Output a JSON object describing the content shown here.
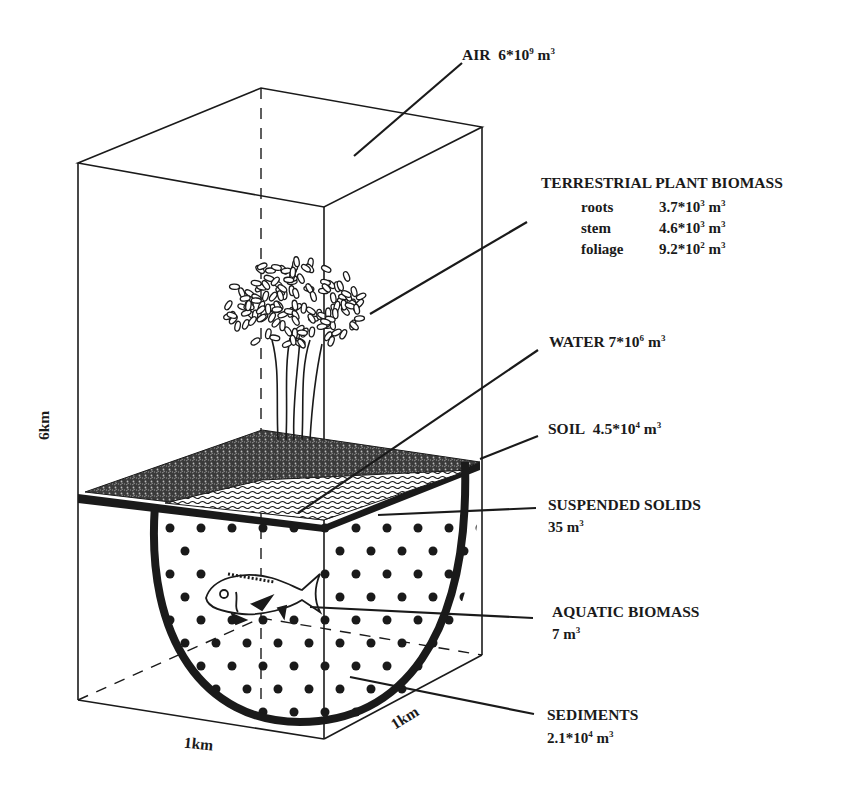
{
  "diagram": {
    "dimensions": {
      "height_label": "6km",
      "width_label": "1km",
      "depth_label": "1km"
    },
    "compartments": {
      "air": {
        "name": "AIR",
        "mantissa": "6*10",
        "exp": "9",
        "unit": "m",
        "unit_exp": "3"
      },
      "plant": {
        "name": "TERRESTRIAL PLANT BIOMASS",
        "parts": [
          {
            "label": "roots",
            "mantissa": "3.7*10",
            "exp": "3",
            "unit": "m",
            "unit_exp": "3"
          },
          {
            "label": "stem",
            "mantissa": "4.6*10",
            "exp": "3",
            "unit": "m",
            "unit_exp": "3"
          },
          {
            "label": "foliage",
            "mantissa": "9.2*10",
            "exp": "2",
            "unit": "m",
            "unit_exp": "3"
          }
        ]
      },
      "water": {
        "name": "WATER",
        "mantissa": "7*10",
        "exp": "6",
        "unit": "m",
        "unit_exp": "3"
      },
      "soil": {
        "name": "SOIL",
        "mantissa": "4.5*10",
        "exp": "4",
        "unit": "m",
        "unit_exp": "3"
      },
      "suspended_solids": {
        "name": "SUSPENDED SOLIDS",
        "value": "35 m",
        "unit_exp": "3"
      },
      "aquatic_biomass": {
        "name": "AQUATIC BIOMASS",
        "value": "7 m",
        "unit_exp": "3"
      },
      "sediments": {
        "name": "SEDIMENTS",
        "mantissa": "2.1*10",
        "exp": "4",
        "unit": "m",
        "unit_exp": "3"
      }
    },
    "colors": {
      "ink": "#1a1a1a",
      "background": "#ffffff"
    }
  }
}
